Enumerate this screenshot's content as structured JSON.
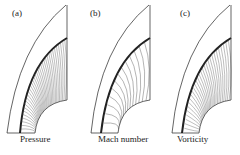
{
  "figure": {
    "panels": [
      {
        "id": "a",
        "label": "(a)",
        "caption": "Pressure"
      },
      {
        "id": "b",
        "label": "(b)",
        "caption": "Mach number"
      },
      {
        "id": "c",
        "label": "(c)",
        "caption": "Vorticity"
      }
    ]
  }
}
